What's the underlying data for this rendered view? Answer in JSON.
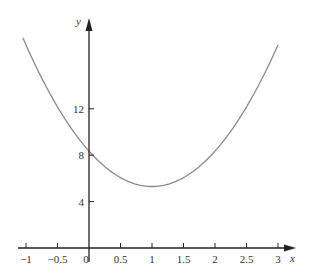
{
  "chart_data": {
    "type": "line",
    "title": "",
    "xlabel": "x",
    "ylabel": "y",
    "xlim": [
      -1.05,
      3.1
    ],
    "ylim": [
      0,
      19
    ],
    "grid": false,
    "legend": null,
    "x_ticks": [
      -1,
      -0.5,
      0,
      0.5,
      1,
      1.5,
      2,
      2.5,
      3
    ],
    "x_tick_labels": [
      "−1",
      "−0.5",
      "0",
      "0.5",
      "1",
      "1.5",
      "2",
      "2.5",
      "3"
    ],
    "y_ticks": [
      4,
      8,
      12
    ],
    "y_tick_labels": [
      "4",
      "8",
      "12"
    ],
    "series": [
      {
        "name": "parabola",
        "color": "#8a8a8a",
        "x": [
          -1.05,
          -1,
          -0.5,
          0,
          0.5,
          1,
          1.5,
          2,
          2.5,
          3
        ],
        "values": [
          17.7,
          17.2,
          12.2,
          8.4,
          6.2,
          5.3,
          6.2,
          8.4,
          12.2,
          17.4
        ]
      }
    ],
    "annotations": []
  },
  "colors": {
    "axis": "#222222",
    "curve": "#8a8a8a"
  }
}
